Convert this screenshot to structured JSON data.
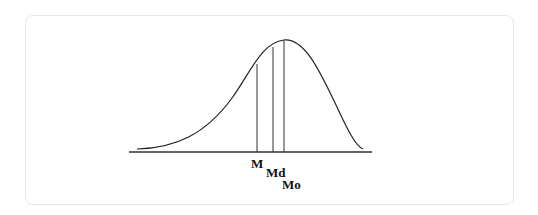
{
  "diagram": {
    "type": "negatively-skewed-distribution",
    "labels": {
      "mean": "M",
      "median": "Md",
      "mode": "Mo"
    },
    "colors": {
      "line": "#222222",
      "card_border": "#e6e6e6",
      "background": "#ffffff"
    }
  }
}
